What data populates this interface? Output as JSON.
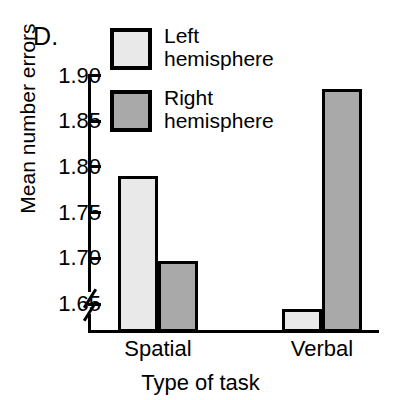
{
  "panel": {
    "label": "D."
  },
  "legend": {
    "position": "top-center",
    "entries": [
      {
        "label": "Left\nhemisphere",
        "color": "#e9e9e9",
        "name": "left-hemisphere"
      },
      {
        "label": "Right\nhemisphere",
        "color": "#a9a9a9",
        "name": "right-hemisphere"
      }
    ]
  },
  "axis": {
    "y_title": "Mean number errors",
    "x_title": "Type of task",
    "y_ticks": [
      "1.65",
      "1.70",
      "1.75",
      "1.80",
      "1.85",
      "1.90"
    ],
    "broken_axis": true
  },
  "chart_data": {
    "type": "bar",
    "title": "D.",
    "xlabel": "Type of task",
    "ylabel": "Mean number errors",
    "categories": [
      "Spatial",
      "Verbal"
    ],
    "series": [
      {
        "name": "Left hemisphere",
        "color": "#e9e9e9",
        "values": [
          1.79,
          1.645
        ]
      },
      {
        "name": "Right hemisphere",
        "color": "#a9a9a9",
        "values": [
          1.697,
          1.885
        ]
      }
    ],
    "ylim": [
      1.65,
      1.9
    ],
    "ytick_step": 0.05,
    "yticks": [
      1.65,
      1.7,
      1.75,
      1.8,
      1.85,
      1.9
    ],
    "axis_break": "y-axis broken below 1.65",
    "grid": false,
    "legend_position": "top-center"
  }
}
